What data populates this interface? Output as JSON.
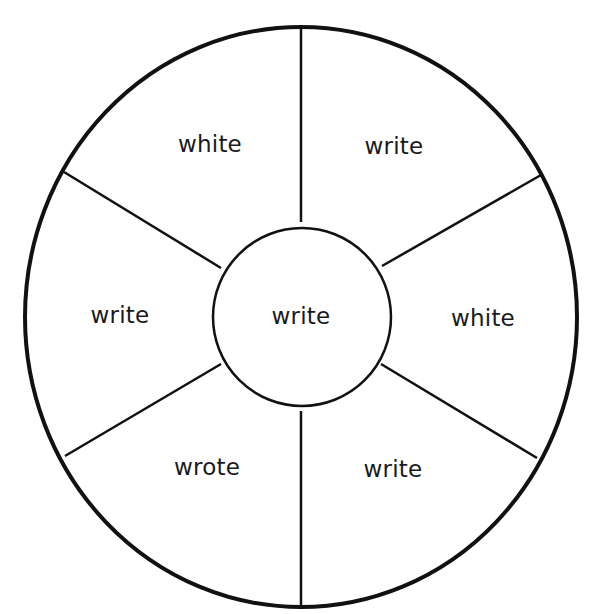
{
  "diagram": {
    "type": "word-wheel",
    "center_word": "write",
    "segments": [
      {
        "position": "top-left",
        "word": "white"
      },
      {
        "position": "top-right",
        "word": "write"
      },
      {
        "position": "left",
        "word": "write"
      },
      {
        "position": "right",
        "word": "white"
      },
      {
        "position": "bottom-left",
        "word": "wrote"
      },
      {
        "position": "bottom-right",
        "word": "write"
      }
    ],
    "colors": {
      "stroke": "#111111",
      "text": "#1a1a1a",
      "background": "#ffffff"
    }
  }
}
